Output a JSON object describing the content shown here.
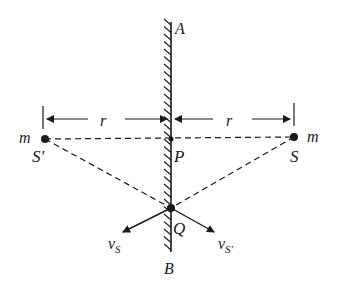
{
  "diagram": {
    "type": "physics-plane-mirror",
    "colors": {
      "line": "#1a1a1a",
      "background": "#ffffff"
    },
    "mirror": {
      "top_label": "A",
      "bottom_label": "B"
    },
    "points": {
      "source": {
        "label": "S",
        "mass_label": "m"
      },
      "image": {
        "label": "S'",
        "mass_label": "m"
      },
      "foot": {
        "label": "P"
      },
      "intersection": {
        "label": "Q"
      }
    },
    "distances": {
      "left": "r",
      "right": "r"
    },
    "velocities": {
      "source": {
        "symbol": "v",
        "subscript": "S"
      },
      "image": {
        "symbol": "v",
        "subscript": "S'"
      }
    }
  }
}
